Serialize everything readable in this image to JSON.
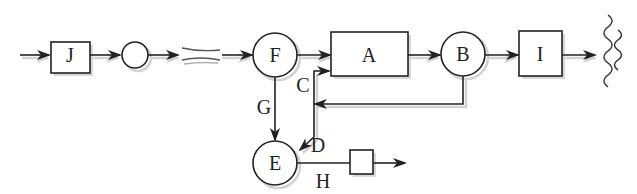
{
  "diagram": {
    "nodes": {
      "J": {
        "label": "J",
        "shape": "box"
      },
      "blank_circle": {
        "label": "",
        "shape": "circle"
      },
      "F": {
        "label": "F",
        "shape": "circle"
      },
      "A": {
        "label": "A",
        "shape": "box"
      },
      "B": {
        "label": "B",
        "shape": "circle"
      },
      "I": {
        "label": "I",
        "shape": "box"
      },
      "E": {
        "label": "E",
        "shape": "circle"
      },
      "small_box": {
        "label": "",
        "shape": "box"
      }
    },
    "edge_labels": {
      "C": "C",
      "G": "G",
      "D": "D",
      "H": "H"
    },
    "colors": {
      "stroke": "#222222",
      "shadow": "#cfcfcf",
      "background": "#ffffff"
    }
  }
}
